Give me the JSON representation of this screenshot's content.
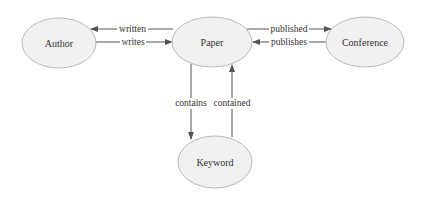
{
  "diagram": {
    "nodes": [
      {
        "id": "author",
        "label": "Author",
        "cx": 59,
        "cy": 43,
        "rx": 37,
        "ry": 25
      },
      {
        "id": "paper",
        "label": "Paper",
        "cx": 212,
        "cy": 42,
        "rx": 40,
        "ry": 25
      },
      {
        "id": "conference",
        "label": "Conference",
        "cx": 365,
        "cy": 42,
        "rx": 39,
        "ry": 25
      },
      {
        "id": "keyword",
        "label": "Keyword",
        "cx": 215,
        "cy": 162,
        "rx": 37,
        "ry": 26
      }
    ],
    "edges": [
      {
        "id": "written",
        "label": "written",
        "from": "paper",
        "to": "author"
      },
      {
        "id": "writes",
        "label": "writes",
        "from": "author",
        "to": "paper"
      },
      {
        "id": "published",
        "label": "published",
        "from": "paper",
        "to": "conference"
      },
      {
        "id": "publishes",
        "label": "publishes",
        "from": "conference",
        "to": "paper"
      },
      {
        "id": "contains",
        "label": "contains",
        "from": "paper",
        "to": "keyword"
      },
      {
        "id": "contained",
        "label": "contained",
        "from": "keyword",
        "to": "paper"
      }
    ]
  },
  "colors": {
    "node_fill": "#f1f1f1",
    "node_stroke": "#b9b9b9",
    "edge": "#555555",
    "text": "#333333"
  }
}
